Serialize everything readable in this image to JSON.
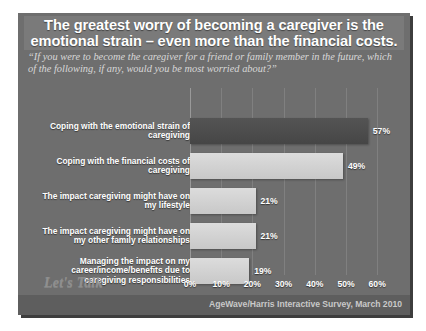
{
  "slide": {
    "title": "The greatest worry of becoming a caregiver is the emotional strain – even more than the financial costs.",
    "subtitle": "“If you were to become the caregiver for a friend or family member in the future, which of the following, if any, would you be most worried about?”",
    "logo": "Let's Talk",
    "attribution": "AgeWave/Harris Interactive Survey, March 2010"
  },
  "colors": {
    "slide_background": "#6e6e6e",
    "title_band": "#7a7a7a",
    "bar_dark": "#4c4c4c",
    "bar_light": "#d2d2d2",
    "footer_band": "#5e5e5e",
    "text_primary": "#ffffff",
    "text_muted": "#d8d8d8"
  },
  "chart_data": {
    "type": "bar",
    "orientation": "horizontal",
    "title": "The greatest worry of becoming a caregiver is the emotional strain – even more than the financial costs.",
    "subtitle": "“If you were to become the caregiver for a friend or family member in the future, which of the following, if any, would you be most worried about?”",
    "categories": [
      "Coping with the emotional strain of caregiving",
      "Coping with the financial costs of caregiving",
      "The impact caregiving might have on my lifestyle",
      "The impact caregiving might have on my other family relationships",
      "Managing the impact on my career/income/benefits due to caregiving responsibilities"
    ],
    "values": [
      57,
      49,
      21,
      21,
      19
    ],
    "value_labels": [
      "57%",
      "49%",
      "21%",
      "21%",
      "19%"
    ],
    "bar_styles": [
      "dark",
      "light",
      "light",
      "light",
      "light"
    ],
    "xlabel": "",
    "ylabel": "",
    "xlim": [
      0,
      65
    ],
    "xticks": [
      0,
      10,
      20,
      30,
      40,
      50,
      60
    ],
    "xtick_labels": [
      "0%",
      "10%",
      "20%",
      "30%",
      "40%",
      "50%",
      "60%"
    ],
    "grid": true,
    "legend": false,
    "source": "AgeWave/Harris Interactive Survey, March 2010"
  }
}
